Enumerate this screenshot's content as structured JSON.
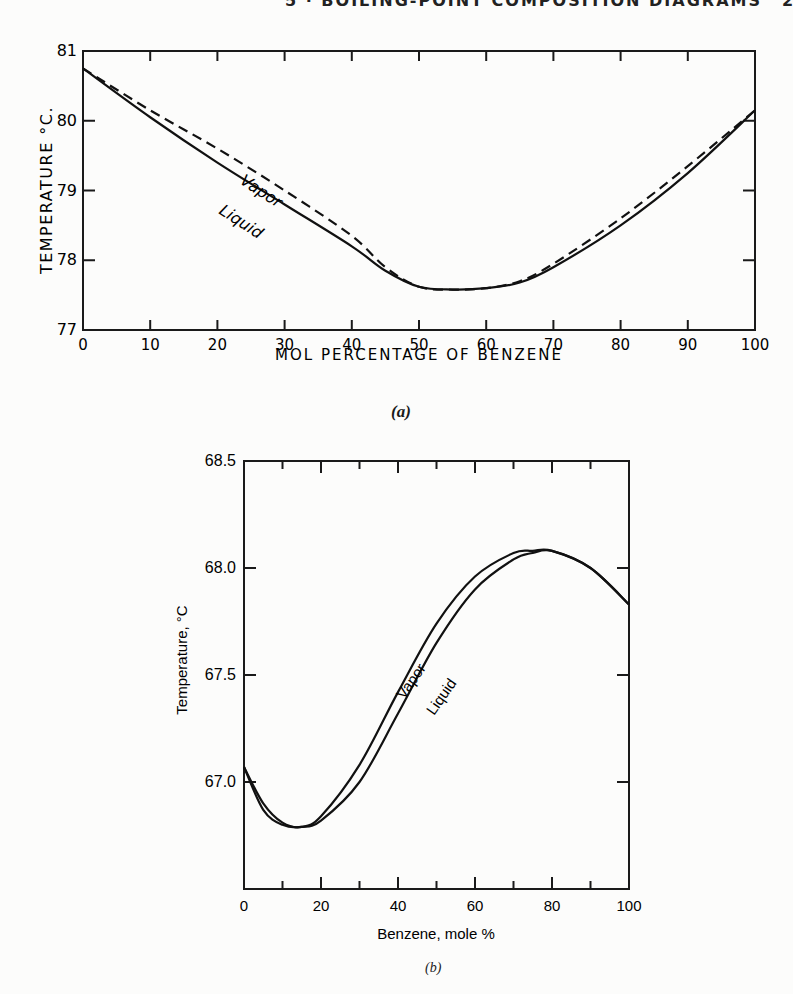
{
  "page": {
    "running_head": "5 · BOILING-POINT COMPOSITION DIAGRAMS",
    "page_number": "2"
  },
  "chart_data": [
    {
      "id": "a",
      "type": "line",
      "caption": "(a)",
      "title": "",
      "xlabel": "MOL PERCENTAGE OF BENZENE",
      "ylabel": "TEMPERATURE °C.",
      "xlim": [
        0,
        100
      ],
      "ylim": [
        77,
        81
      ],
      "x_ticks": [
        0,
        10,
        20,
        30,
        40,
        50,
        60,
        70,
        80,
        90,
        100
      ],
      "y_ticks": [
        77,
        78,
        79,
        80,
        81
      ],
      "grid": false,
      "legend": "inline labels on curves",
      "series": [
        {
          "name": "Vapor",
          "style": "dashed",
          "x": [
            0,
            10,
            20,
            30,
            40,
            45,
            50,
            55,
            60,
            65,
            70,
            80,
            90,
            100
          ],
          "values": [
            80.75,
            80.15,
            79.6,
            79.0,
            78.35,
            77.9,
            77.62,
            77.58,
            77.6,
            77.7,
            77.95,
            78.6,
            79.35,
            80.15
          ]
        },
        {
          "name": "Liquid",
          "style": "solid",
          "x": [
            0,
            10,
            20,
            30,
            40,
            45,
            50,
            55,
            60,
            65,
            70,
            80,
            90,
            100
          ],
          "values": [
            80.75,
            80.05,
            79.4,
            78.8,
            78.2,
            77.85,
            77.62,
            77.58,
            77.6,
            77.68,
            77.9,
            78.5,
            79.25,
            80.15
          ]
        }
      ],
      "annotations": [
        "Vapor",
        "Liquid"
      ]
    },
    {
      "id": "b",
      "type": "line",
      "caption": "(b)",
      "title": "",
      "xlabel": "Benzene, mole %",
      "ylabel": "Temperature, °C",
      "xlim": [
        0,
        100
      ],
      "ylim": [
        66.5,
        68.5
      ],
      "x_ticks": [
        0,
        20,
        40,
        60,
        80,
        100
      ],
      "x_minor_ticks": [
        10,
        30,
        50,
        70,
        90
      ],
      "y_ticks": [
        66.5,
        67.0,
        67.5,
        68.0,
        68.5
      ],
      "y_tick_labels": [
        "",
        "67.0",
        "67.5",
        "68.0",
        "68.5"
      ],
      "grid": false,
      "legend": "inline labels on curves",
      "series": [
        {
          "name": "Vapor",
          "style": "solid",
          "x": [
            0,
            5,
            10,
            15,
            20,
            30,
            40,
            50,
            60,
            70,
            75,
            80,
            90,
            100
          ],
          "values": [
            67.07,
            66.9,
            66.81,
            66.79,
            66.84,
            67.08,
            67.42,
            67.74,
            67.96,
            68.07,
            68.08,
            68.08,
            68.0,
            67.83
          ]
        },
        {
          "name": "Liquid",
          "style": "solid",
          "x": [
            0,
            5,
            10,
            15,
            20,
            30,
            40,
            50,
            60,
            70,
            75,
            80,
            90,
            100
          ],
          "values": [
            67.07,
            66.87,
            66.8,
            66.79,
            66.82,
            67.0,
            67.32,
            67.65,
            67.9,
            68.04,
            68.07,
            68.08,
            68.0,
            67.83
          ]
        }
      ],
      "annotations": [
        "Vapor",
        "Liquid"
      ]
    }
  ],
  "labels": {
    "a_vapor": "Vapor",
    "a_liquid": "Liquid",
    "b_vapor": "Vapor",
    "b_liquid": "Liquid"
  }
}
